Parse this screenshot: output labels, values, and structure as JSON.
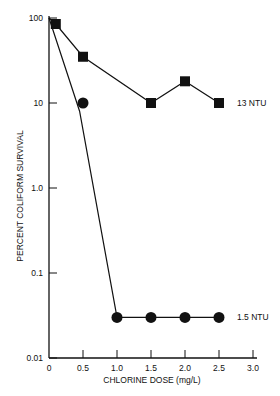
{
  "chart_data": {
    "type": "line",
    "title": "",
    "xlabel": "CHLORINE DOSE (mg/L)",
    "ylabel": "PERCENT COLIFORM SURVIVAL",
    "yscale": "log",
    "xlim": [
      0,
      3.0
    ],
    "ylim": [
      0.01,
      100
    ],
    "x_ticks": [
      "0",
      "0.5",
      "1.0",
      "1.5",
      "2.0",
      "2.5",
      "3.0"
    ],
    "y_ticks": [
      "0.01",
      "0.1",
      "1.0",
      "10",
      "100"
    ],
    "grid": false,
    "series": [
      {
        "name": "13 NTU",
        "marker": "square",
        "line_points": [
          [
            0,
            100
          ],
          [
            0.1,
            85
          ],
          [
            0.5,
            35
          ],
          [
            1.5,
            10
          ],
          [
            2.0,
            18
          ],
          [
            2.5,
            10
          ]
        ],
        "markers": [
          [
            0.1,
            85
          ],
          [
            0.5,
            35
          ],
          [
            1.5,
            10
          ],
          [
            2.0,
            18
          ],
          [
            2.5,
            10
          ]
        ]
      },
      {
        "name": "1.5 NTU",
        "marker": "circle",
        "line_points": [
          [
            0,
            100
          ],
          [
            0.45,
            8
          ],
          [
            1.0,
            0.03
          ],
          [
            1.5,
            0.03
          ],
          [
            2.0,
            0.03
          ],
          [
            2.5,
            0.03
          ]
        ],
        "markers": [
          [
            0.5,
            10
          ],
          [
            1.0,
            0.03
          ],
          [
            1.5,
            0.03
          ],
          [
            2.0,
            0.03
          ],
          [
            2.5,
            0.03
          ]
        ]
      }
    ],
    "annotations": [
      "13 NTU",
      "1.5 NTU"
    ]
  }
}
